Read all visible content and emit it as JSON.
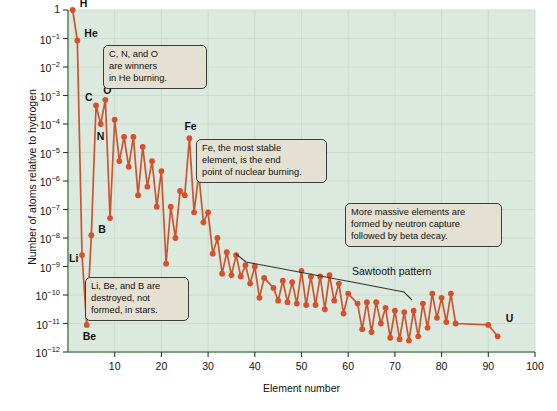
{
  "chart_data": {
    "type": "line",
    "title": "",
    "xlabel": "Element number",
    "ylabel": "Number of atoms relative to hydrogen",
    "xlim": [
      0,
      100
    ],
    "ylim_log10": [
      -12,
      0
    ],
    "xticks": [
      10,
      20,
      30,
      40,
      50,
      60,
      70,
      80,
      90,
      100
    ],
    "yticks": [
      "1",
      "10-1",
      "10-2",
      "10-3",
      "10-4",
      "10-5",
      "10-6",
      "10-7",
      "10-8",
      "10-9",
      "10-10",
      "10-11",
      "10-12"
    ],
    "ytick_exponents": [
      "",
      "-1",
      "-2",
      "-3",
      "-4",
      "-5",
      "-6",
      "-7",
      "-8",
      "-9",
      "-10",
      "-11",
      "-12"
    ],
    "grid": true,
    "series_name": "Solar system abundance relative to hydrogen",
    "marker_color": "#d94f2a",
    "line_color": "#cc5530",
    "plot_background": "#dce9df",
    "x": [
      1,
      2,
      3,
      4,
      5,
      6,
      7,
      8,
      9,
      10,
      11,
      12,
      13,
      14,
      15,
      16,
      17,
      18,
      19,
      20,
      21,
      22,
      23,
      24,
      25,
      26,
      27,
      28,
      29,
      30,
      31,
      32,
      33,
      34,
      35,
      36,
      37,
      38,
      39,
      40,
      41,
      42,
      44,
      45,
      46,
      47,
      48,
      49,
      50,
      51,
      52,
      53,
      54,
      55,
      56,
      57,
      58,
      59,
      60,
      62,
      63,
      64,
      65,
      66,
      67,
      68,
      69,
      70,
      71,
      72,
      73,
      74,
      75,
      76,
      77,
      78,
      79,
      80,
      81,
      82,
      83,
      90,
      92
    ],
    "log10_y": [
      0,
      -1.07,
      -8.6,
      -11.05,
      -7.9,
      -3.35,
      -4.0,
      -3.15,
      -7.3,
      -3.85,
      -5.3,
      -4.45,
      -5.5,
      -4.45,
      -6.5,
      -4.8,
      -6.2,
      -5.3,
      -6.9,
      -5.65,
      -8.9,
      -6.9,
      -8.0,
      -6.35,
      -6.5,
      -4.5,
      -7.1,
      -5.75,
      -7.45,
      -7.1,
      -8.55,
      -8.0,
      -9.25,
      -8.5,
      -9.3,
      -8.6,
      -9.35,
      -8.95,
      -9.6,
      -9.0,
      -10.1,
      -9.4,
      -9.75,
      -10.2,
      -9.5,
      -10.25,
      -9.55,
      -10.3,
      -9.15,
      -10.35,
      -9.35,
      -10.35,
      -9.35,
      -10.5,
      -9.3,
      -10.2,
      -9.6,
      -10.65,
      -9.95,
      -10.3,
      -11.2,
      -10.25,
      -11.3,
      -10.25,
      -11.0,
      -10.45,
      -11.5,
      -10.55,
      -11.55,
      -10.6,
      -11.6,
      -10.55,
      -11.45,
      -10.3,
      -11.15,
      -9.95,
      -10.8,
      -10.1,
      -10.95,
      -9.95,
      -11.0,
      -11.05,
      -11.45
    ]
  },
  "element_labels": [
    {
      "symbol": "H",
      "z": 1,
      "log10_y": 0,
      "dx": 7,
      "dy": -6
    },
    {
      "symbol": "He",
      "z": 2,
      "log10_y": -1.07,
      "dx": 7,
      "dy": -6
    },
    {
      "symbol": "Li",
      "z": 3,
      "log10_y": -8.6,
      "dx": -13,
      "dy": 4
    },
    {
      "symbol": "Be",
      "z": 4,
      "log10_y": -11.05,
      "dx": -4,
      "dy": 12
    },
    {
      "symbol": "B",
      "z": 5,
      "log10_y": -7.9,
      "dx": 7,
      "dy": -5
    },
    {
      "symbol": "C",
      "z": 6,
      "log10_y": -3.35,
      "dx": -11,
      "dy": -7
    },
    {
      "symbol": "N",
      "z": 7,
      "log10_y": -4.0,
      "dx": -4,
      "dy": 13
    },
    {
      "symbol": "O",
      "z": 8,
      "log10_y": -3.15,
      "dx": -2,
      "dy": -9
    },
    {
      "symbol": "Fe",
      "z": 26,
      "log10_y": -4.5,
      "dx": -5,
      "dy": -11
    },
    {
      "symbol": "U",
      "z": 92,
      "log10_y": -11.05,
      "dx": 8,
      "dy": -6
    }
  ],
  "callouts": [
    {
      "name": "he-burning-callout",
      "text": "C, N, and O\nare winners\nin He burning.",
      "x": 103,
      "y": 45,
      "w": 92
    },
    {
      "name": "iron-peak-callout",
      "text": "Fe, the most stable\nelement, is the end\npoint of nuclear burning.",
      "x": 196,
      "y": 139,
      "w": 119
    },
    {
      "name": "light-element-callout",
      "text": "Li, Be, and B are\ndestroyed, not\nformed, in stars.",
      "x": 85,
      "y": 277,
      "w": 92
    },
    {
      "name": "neutron-capture-callout",
      "text": "More massive elements are\nformed by neutron capture\nfollowed by beta decay.",
      "x": 345,
      "y": 203,
      "w": 145
    }
  ],
  "annotations": {
    "sawtooth_label": "Sawtooth pattern",
    "sawtooth_x": 352,
    "sawtooth_y": 265
  }
}
